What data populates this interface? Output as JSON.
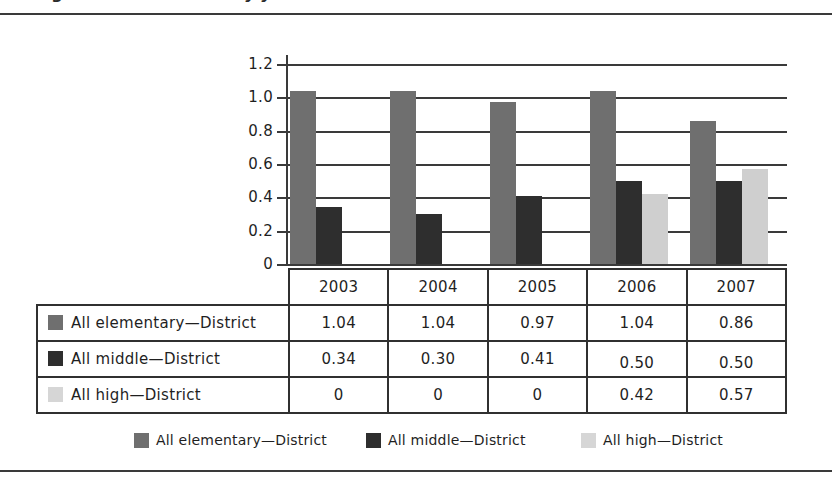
{
  "figure": {
    "title": "Figure: district ratios by year"
  },
  "chart_data": {
    "type": "bar",
    "title": "",
    "xlabel": "",
    "ylabel": "",
    "ylim": [
      0,
      1.2
    ],
    "grid": true,
    "legend_position": "bottom",
    "categories": [
      "2003",
      "2004",
      "2005",
      "2006",
      "2007"
    ],
    "y_ticks": [
      "1.2",
      "1.0",
      "0.8",
      "0.6",
      "0.4",
      "0.2",
      "0"
    ],
    "y_tick_values": [
      1.2,
      1.0,
      0.8,
      0.6,
      0.4,
      0.2,
      0
    ],
    "series": [
      {
        "name": "All elementary—District",
        "color": "#6f6f6f",
        "values": [
          1.04,
          1.04,
          0.97,
          1.04,
          0.86
        ],
        "labels": [
          "1.04",
          "1.04",
          "0.97",
          "1.04",
          "0.86"
        ]
      },
      {
        "name": "All middle—District",
        "color": "#2e2e2e",
        "values": [
          0.34,
          0.3,
          0.41,
          0.5,
          0.5
        ],
        "labels": [
          "0.34",
          "0.30",
          "0.41",
          "0.50",
          "0.50"
        ]
      },
      {
        "name": "All high—District",
        "color": "#cfcfcf",
        "values": [
          0,
          0,
          0,
          0.42,
          0.57
        ],
        "labels": [
          "0",
          "0",
          "0",
          "0.42",
          "0.57"
        ]
      }
    ]
  }
}
